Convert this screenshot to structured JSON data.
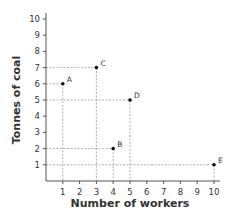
{
  "chart_data": {
    "type": "scatter",
    "title": "",
    "xlabel": "Number of workers",
    "ylabel": "Tonnes of coal",
    "xlim": [
      0,
      10
    ],
    "ylim": [
      0,
      10
    ],
    "x_ticks": [
      1,
      2,
      3,
      4,
      5,
      6,
      7,
      8,
      9,
      10
    ],
    "y_ticks": [
      1,
      2,
      3,
      4,
      5,
      6,
      7,
      8,
      9,
      10
    ],
    "grid": false,
    "guide_lines": "dashed drop lines from each point to both axes",
    "points": [
      {
        "label": "A",
        "x": 1,
        "y": 6
      },
      {
        "label": "B",
        "x": 4,
        "y": 2
      },
      {
        "label": "C",
        "x": 3,
        "y": 7
      },
      {
        "label": "D",
        "x": 5,
        "y": 5
      },
      {
        "label": "E",
        "x": 10,
        "y": 1
      }
    ]
  },
  "colors": {
    "axis": "#555555",
    "guide": "#9a9a9a",
    "point": "#111111",
    "text": "#333333"
  }
}
